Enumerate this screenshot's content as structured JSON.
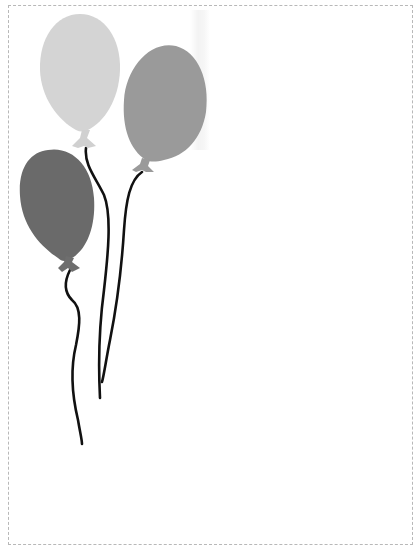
{
  "page": {
    "background": "#ffffff",
    "border_color": "#b8b8b8",
    "border_style": "dashed"
  },
  "illustration": {
    "subject": "three balloons on strings",
    "balloons": [
      {
        "name": "light-balloon",
        "color": "#d4d4d4",
        "cx": 80,
        "cy": 70,
        "rx": 40,
        "ry": 58
      },
      {
        "name": "medium-balloon",
        "color": "#9a9a9a",
        "cx": 166,
        "cy": 100,
        "rx": 42,
        "ry": 58,
        "tilt": 15
      },
      {
        "name": "dark-balloon",
        "color": "#6a6a6a",
        "cx": 56,
        "cy": 204,
        "rx": 37,
        "ry": 55,
        "tilt": -12
      }
    ],
    "string_color": "#111111"
  }
}
